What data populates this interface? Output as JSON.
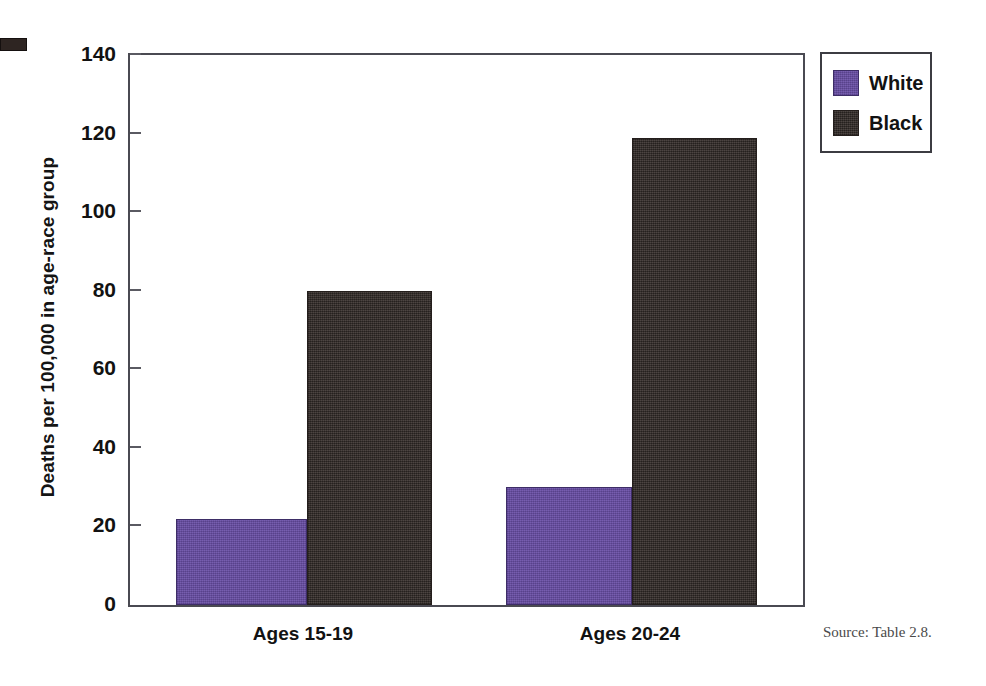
{
  "chart_data": {
    "type": "bar",
    "title": "",
    "subtitle": "",
    "xlabel": "",
    "ylabel": "Deaths per 100,000 in age-race group",
    "categories": [
      "Ages 15-19",
      "Ages 20-24"
    ],
    "series": [
      {
        "name": "White",
        "values": [
          22,
          30
        ],
        "color": "#6a4fa8"
      },
      {
        "name": "Black",
        "values": [
          80,
          119
        ],
        "color": "#3b3330"
      }
    ],
    "ylim": [
      0,
      140
    ],
    "yticks": [
      0,
      20,
      40,
      60,
      80,
      100,
      120,
      140
    ],
    "ytick_labels": [
      "0",
      "20",
      "40",
      "60",
      "80",
      "100",
      "120",
      "140"
    ],
    "grid": false,
    "legend_position": "right-top",
    "legend_entries": [
      "White",
      "Black"
    ]
  },
  "legend": {
    "entries": [
      {
        "label": "White",
        "swatch": "white-series-swatch"
      },
      {
        "label": "Black",
        "swatch": "black-series-swatch"
      }
    ]
  },
  "axis": {
    "y_title": "Deaths per 100,000 in age-race group",
    "tick_140": "140",
    "tick_120": "120",
    "tick_100": "100",
    "tick_80": "80",
    "tick_60": "60",
    "tick_40": "40",
    "tick_20": "20",
    "tick_0": "0"
  },
  "categories": {
    "group1": "Ages 15-19",
    "group2": "Ages 20-24"
  },
  "footer": {
    "source": "Source: Table 2.8."
  }
}
